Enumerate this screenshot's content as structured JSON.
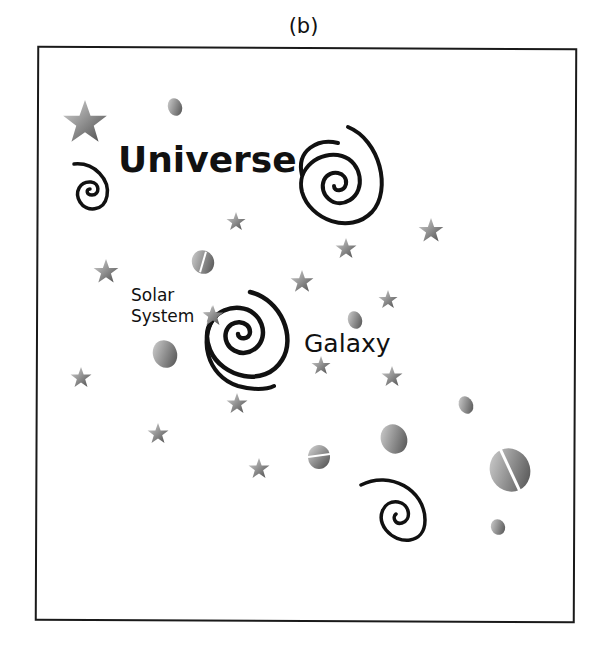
{
  "figure": {
    "caption": "(b)",
    "labels": {
      "universe": "Universe",
      "galaxy": "Galaxy",
      "solar_line1": "Solar",
      "solar_line2": "System"
    }
  },
  "colors": {
    "ink": "#111111",
    "star_light": "#cfcfcf",
    "star_dark": "#5a5a5a"
  }
}
